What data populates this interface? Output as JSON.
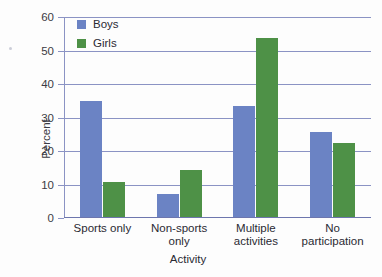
{
  "chart_data": {
    "type": "bar",
    "title": "",
    "xlabel": "Activity",
    "ylabel": "Percent",
    "ylim": [
      0,
      60
    ],
    "yticks": [
      0,
      10,
      20,
      30,
      40,
      50,
      60
    ],
    "grid": true,
    "legend_position": "top-left",
    "categories": [
      "Sports only",
      "Non-sports\nonly",
      "Multiple\nactivities",
      "No\nparticipation"
    ],
    "series": [
      {
        "name": "Boys",
        "color": "#6b83c4",
        "values": [
          34.5,
          7,
          33,
          25.5
        ]
      },
      {
        "name": "Girls",
        "color": "#4e9147",
        "values": [
          10.5,
          14,
          53.5,
          22
        ]
      }
    ]
  },
  "legend": {
    "items": [
      {
        "label": "Boys",
        "swatch": "boys-swatch"
      },
      {
        "label": "Girls",
        "swatch": "girls-swatch"
      }
    ]
  },
  "axis": {
    "y_title": "Percent",
    "x_title": "Activity",
    "y_tick_labels": [
      "0",
      "10",
      "20",
      "30",
      "40",
      "50",
      "60"
    ]
  }
}
